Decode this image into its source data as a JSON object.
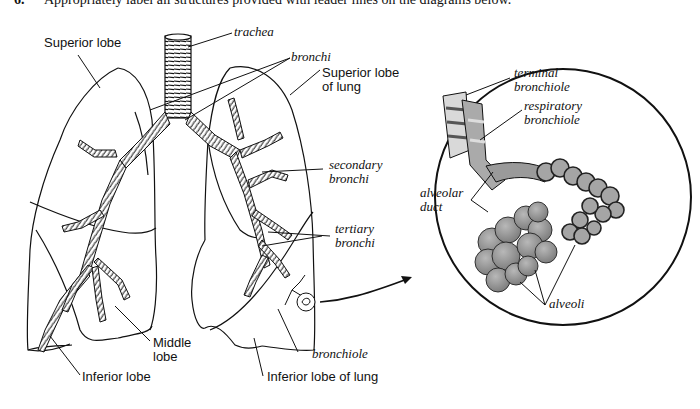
{
  "instruction": {
    "number": "6.",
    "text": "Appropriately label all structures provided with leader lines on the diagrams below."
  },
  "lungs_diagram": {
    "labels": {
      "trachea": "trachea",
      "bronchi": "bronchi",
      "superior_lobe": "Superior lobe",
      "superior_lobe_of_lung_line1": "Superior lobe",
      "superior_lobe_of_lung_line2": "of lung",
      "secondary_bronchi_line1": "secondary",
      "secondary_bronchi_line2": "bronchi",
      "tertiary_bronchi_line1": "tertiary",
      "tertiary_bronchi_line2": "bronchi",
      "middle_lobe_line1": "Middle",
      "middle_lobe_line2": "lobe",
      "inferior_lobe": "Inferior lobe",
      "bronchiole": "bronchiole",
      "inferior_lobe_of_lung": "Inferior lobe of lung"
    }
  },
  "alveoli_inset": {
    "labels": {
      "terminal_bronchiole_line1": "terminal",
      "terminal_bronchiole_line2": "bronchiole",
      "respiratory_bronchiole_line1": "respiratory",
      "respiratory_bronchiole_line2": "bronchiole",
      "alveolar_duct_line1": "alveolar",
      "alveolar_duct_line2": "duct",
      "alveoli": "alveoli"
    },
    "tissue_color": "#9a9a9a"
  }
}
